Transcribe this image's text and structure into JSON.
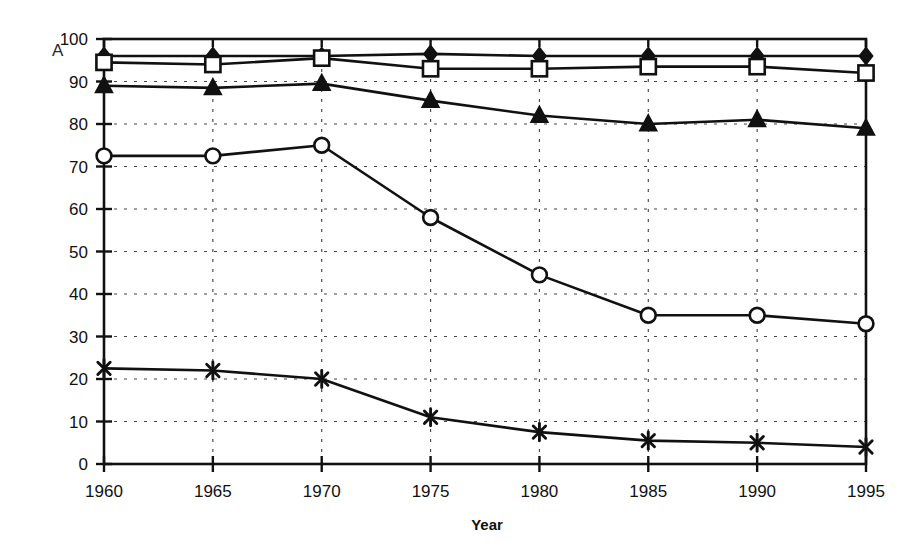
{
  "figure": {
    "panel_label": "A",
    "background": "#ffffff",
    "ink_color": "#111111"
  },
  "chart_data": {
    "type": "line",
    "title": "",
    "subtitle": "",
    "xlabel": "Year",
    "ylabel": "",
    "x": [
      1960,
      1965,
      1970,
      1975,
      1980,
      1985,
      1990,
      1995
    ],
    "categories": [
      "1960",
      "1965",
      "1970",
      "1975",
      "1980",
      "1985",
      "1990",
      "1995"
    ],
    "xlim": [
      1960,
      1995
    ],
    "ylim": [
      0,
      100
    ],
    "ytick_values": [
      0,
      10,
      20,
      30,
      40,
      50,
      60,
      70,
      80,
      90,
      100
    ],
    "ytick_labels": [
      "0",
      "10",
      "20",
      "30",
      "40",
      "50",
      "60",
      "70",
      "80",
      "90",
      "100"
    ],
    "xtick_labels": [
      "1960",
      "1965",
      "1970",
      "1975",
      "1980",
      "1985",
      "1990",
      "1995"
    ],
    "grid": true,
    "grid_style": "dotted-horizontal-and-vertical",
    "legend": false,
    "legend_position": "none",
    "series": [
      {
        "name": "series-1",
        "marker": "filled-diamond",
        "values": [
          96,
          96,
          96,
          96.5,
          96,
          96,
          96,
          96
        ]
      },
      {
        "name": "series-2",
        "marker": "open-square",
        "values": [
          94.5,
          94,
          95.5,
          93,
          93,
          93.5,
          93.5,
          92
        ]
      },
      {
        "name": "series-3",
        "marker": "filled-triangle",
        "values": [
          89,
          88.5,
          89.5,
          85.5,
          82,
          80,
          81,
          79
        ]
      },
      {
        "name": "series-4",
        "marker": "open-circle",
        "values": [
          72.5,
          72.5,
          75,
          58,
          44.5,
          35,
          35,
          33
        ]
      },
      {
        "name": "series-5",
        "marker": "asterisk",
        "values": [
          22.5,
          22,
          20,
          11,
          7.5,
          5.5,
          5,
          4
        ]
      }
    ]
  }
}
